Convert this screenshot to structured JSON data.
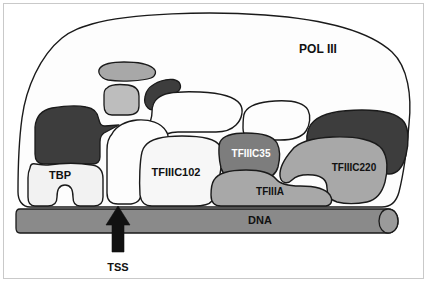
{
  "figure": {
    "type": "schematic-diagram",
    "width": 429,
    "height": 284,
    "background_color": "#ffffff",
    "frame_color": "#c9c9c9",
    "outline_color": "#1a1a1a"
  },
  "palette": {
    "white": "#fdfdfd",
    "near_white": "#f2f2f2",
    "light_gray": "#bdbdbd",
    "mid_gray": "#a8a8a8",
    "dna_gray": "#8a8a8a",
    "dark_gray": "#7d7d7d",
    "darkest_gray": "#3d3d3d",
    "outline": "#1a1a1a",
    "text_dark": "#111111",
    "text_light": "#ffffff"
  },
  "labels": {
    "pol3": "POL III",
    "tbp": "TBP",
    "tfiiic102": "TFIIIC102",
    "tfiiic35": "TFIIIC35",
    "tfiiia": "TFIIIA",
    "tfiiic220": "TFIIIC220",
    "dna": "DNA",
    "tss": "TSS"
  },
  "components": [
    {
      "id": "pol3",
      "label": "POL III",
      "fill": "#fdfdfd",
      "text_color": "#111111",
      "label_x": 318,
      "label_y": 50,
      "font_size": 12,
      "description": "large enveloping white body labelled POL III"
    },
    {
      "id": "tbp",
      "label": "TBP",
      "fill": "#f2f2f2",
      "text_color": "#111111",
      "label_x": 60,
      "label_y": 176,
      "font_size": 11,
      "description": "saddle shaped subunit at left sitting on DNA"
    },
    {
      "id": "tfiiic102",
      "label": "TFIIIC102",
      "fill": "#f7f7f7",
      "text_color": "#111111",
      "label_x": 176,
      "label_y": 173,
      "font_size": 11,
      "description": "white central subunit"
    },
    {
      "id": "tfiiic35",
      "label": "TFIIIC35",
      "fill": "#7d7d7d",
      "text_color": "#ffffff",
      "label_x": 251,
      "label_y": 154,
      "font_size": 10,
      "description": "dark gray subunit with white lettering"
    },
    {
      "id": "tfiiia",
      "label": "TFIIIA",
      "fill": "#a8a8a8",
      "text_color": "#111111",
      "label_x": 270,
      "label_y": 192,
      "font_size": 10,
      "description": "mid gray subunit resting on DNA"
    },
    {
      "id": "tfiiic220",
      "label": "TFIIIC220",
      "fill": "#a8a8a8",
      "text_color": "#111111",
      "label_x": 354,
      "label_y": 168,
      "font_size": 10,
      "description": "mid gray subunit at right"
    },
    {
      "id": "dna",
      "label": "DNA",
      "fill": "#8a8a8a",
      "text_color": "#111111",
      "label_x": 260,
      "label_y": 220,
      "font_size": 11,
      "description": "horizontal gray duplex cylinder with rounded right cap"
    }
  ],
  "unlabeled_shapes": [
    {
      "id": "dark-blob-left",
      "fill": "#3d3d3d",
      "description": "large dark subunit upper left with pointed right tip"
    },
    {
      "id": "gray-blob-top",
      "fill": "#a8a8a8",
      "description": "small horizontal gray blob top centre-left"
    },
    {
      "id": "light-blob-top",
      "fill": "#bdbdbd",
      "description": "small light gray square blob below gray-blob-top"
    },
    {
      "id": "dark-blob-top",
      "fill": "#3d3d3d",
      "description": "small dark curved blob right of light-blob-top"
    },
    {
      "id": "white-blob-upper-mid",
      "fill": "#fdfdfd",
      "description": "white lobed subunit upper middle"
    },
    {
      "id": "white-blob-left-stalk",
      "fill": "#fdfdfd",
      "description": "white vertical stalk subunit left of centre"
    },
    {
      "id": "white-blob-upper-right",
      "fill": "#fdfdfd",
      "description": "white rounded subunit above TFIIIC35"
    },
    {
      "id": "dark-blob-right",
      "fill": "#3d3d3d",
      "description": "large dark crescent subunit at right"
    }
  ],
  "annotations": [
    {
      "id": "tss-arrow",
      "label": "TSS",
      "meaning": "transcription start site",
      "direction": "up",
      "tip_x": 118,
      "tip_y": 206,
      "label_x": 118,
      "label_y": 268,
      "font_size": 11,
      "color": "#111111"
    }
  ]
}
